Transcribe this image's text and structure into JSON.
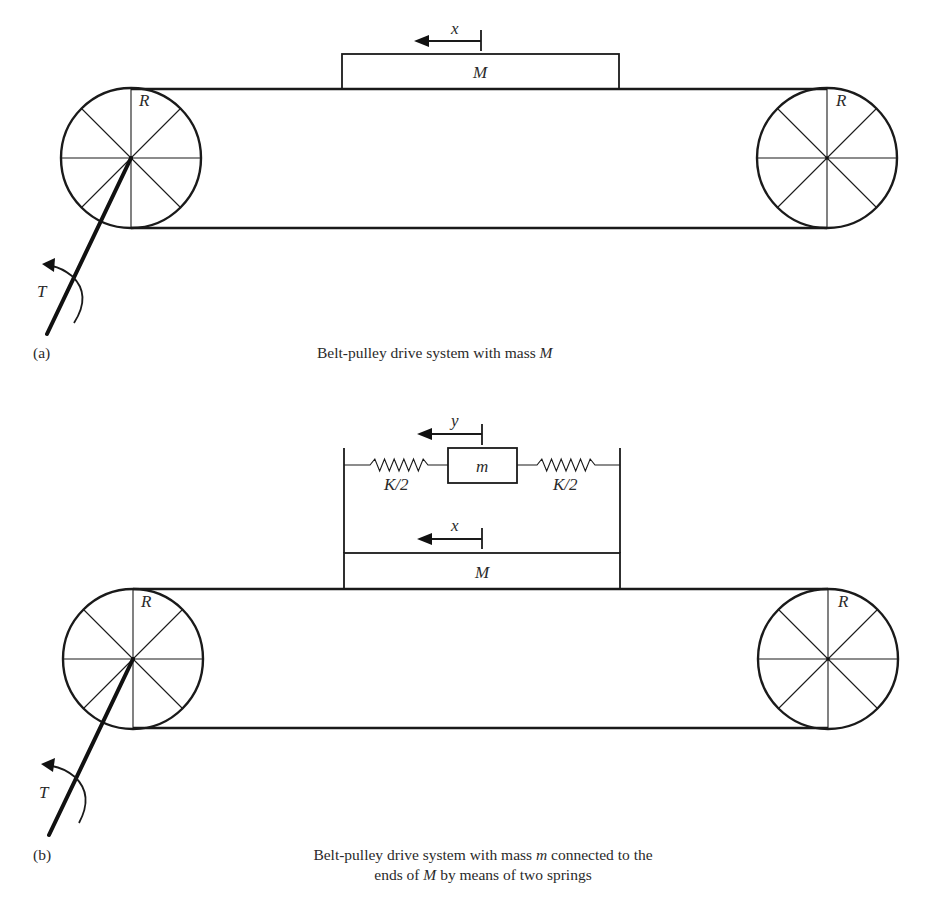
{
  "figure": {
    "panels": [
      {
        "id": "a",
        "tag": "(a)",
        "caption_parts": [
          {
            "text": "Belt-pulley drive system with mass ",
            "italic": false
          },
          {
            "text": "M",
            "italic": true
          }
        ],
        "labels": {
          "mass": "M",
          "displacement_mass": "x",
          "pulley_left_radius": "R",
          "pulley_right_radius": "R",
          "torque": "T"
        }
      },
      {
        "id": "b",
        "tag": "(b)",
        "caption_line1_parts": [
          {
            "text": "Belt-pulley drive system with mass ",
            "italic": false
          },
          {
            "text": "m",
            "italic": true
          },
          {
            "text": " connected to the",
            "italic": false
          }
        ],
        "caption_line2_parts": [
          {
            "text": "ends of ",
            "italic": false
          },
          {
            "text": "M",
            "italic": true
          },
          {
            "text": " by means of two springs",
            "italic": false
          }
        ],
        "labels": {
          "mass": "M",
          "small_mass": "m",
          "displacement_mass": "x",
          "displacement_small_mass": "y",
          "spring_left": "K/2",
          "spring_right": "K/2",
          "pulley_left_radius": "R",
          "pulley_right_radius": "R",
          "torque": "T"
        }
      }
    ]
  },
  "icons": {
    "displacement_arrow": "left-arrow",
    "torque_arrow": "counterclockwise-arc-arrow",
    "pulley": "spoked-wheel",
    "spring": "zigzag-spring"
  }
}
